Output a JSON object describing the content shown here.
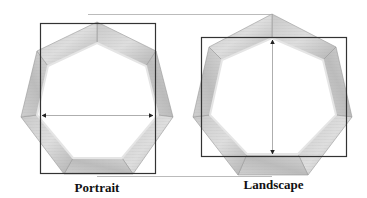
{
  "figure": {
    "colors": {
      "wood_light": "#d8d8d8",
      "wood_mid": "#bdbdbd",
      "wood_dark": "#9a9a9a",
      "rect_stroke": "#333333",
      "guide_line": "#bbbbbb",
      "arrow": "#222222"
    },
    "panels": [
      {
        "label": "Portrait",
        "orientation": "vertex-up",
        "dimension_arrow": "horizontal"
      },
      {
        "label": "Landscape",
        "orientation": "vertex-up",
        "dimension_arrow": "vertical"
      }
    ]
  }
}
